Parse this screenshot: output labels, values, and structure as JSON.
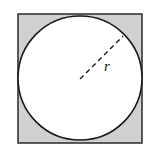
{
  "diagram": {
    "square": {
      "x": 18,
      "y": 14,
      "width": 124,
      "height": 129,
      "fill": "#d0d0d0",
      "stroke": "#2a2a2a"
    },
    "circle": {
      "cx": 80,
      "cy": 78,
      "r": 62,
      "fill": "#ffffff",
      "stroke": "#1a1a1a"
    },
    "radius_line": {
      "x1": 80,
      "y1": 79,
      "x2": 123,
      "y2": 36,
      "style": "dashed"
    },
    "radius_label": "r"
  }
}
